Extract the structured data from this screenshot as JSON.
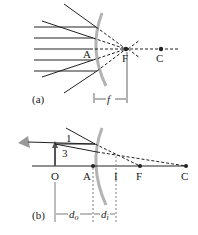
{
  "figure_a": {
    "caption": "(a)",
    "labels": {
      "vertex": "A",
      "focal": "F",
      "center": "C",
      "focal_length": "f"
    }
  },
  "figure_b": {
    "caption": "(b)",
    "labels": {
      "object": "O",
      "vertex": "A",
      "image": "I",
      "focal": "F",
      "center": "C",
      "ray1": "1",
      "ray3": "3",
      "d_object": "d",
      "d_object_sub": "o",
      "d_image": "d",
      "d_image_sub": "i"
    }
  },
  "colors": {
    "mirror": "#b3b3b3",
    "line": "#222222",
    "object_arrow": "#555555"
  }
}
